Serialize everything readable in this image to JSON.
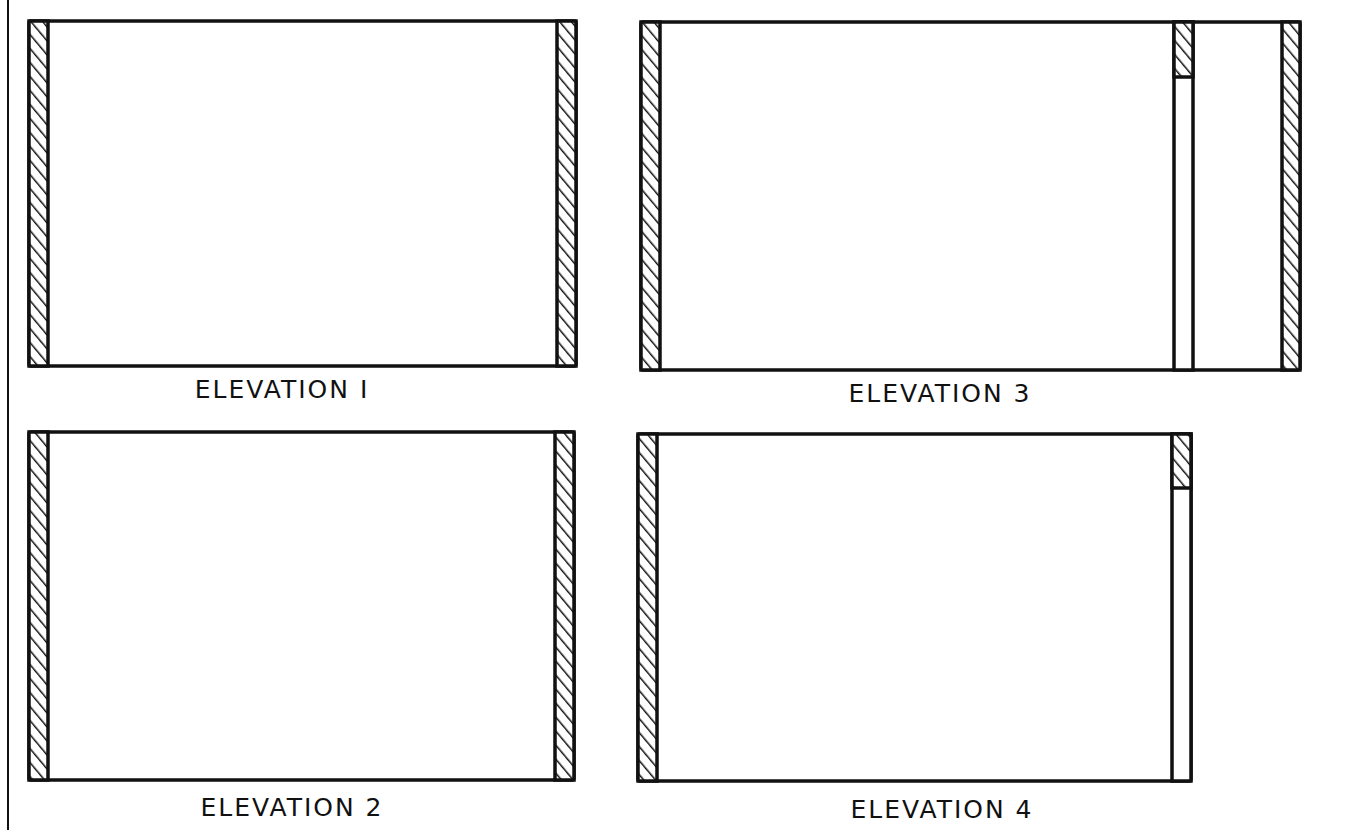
{
  "drawing": {
    "ink_color": "#111111",
    "background": "#ffffff",
    "hatch": "diagonal"
  },
  "elevations": [
    {
      "id": 1,
      "label": "ELEVATION I",
      "frame": {
        "x": 29,
        "y": 21,
        "w": 547,
        "h": 345
      },
      "walls": [
        {
          "x": 29,
          "y": 21,
          "w": 19,
          "h": 345
        },
        {
          "x": 557,
          "y": 21,
          "w": 19,
          "h": 345
        }
      ],
      "openings": [],
      "label_pos": {
        "cx": 282,
        "y": 375
      }
    },
    {
      "id": 3,
      "label": "ELEVATION 3",
      "frame": {
        "x": 641,
        "y": 22,
        "w": 659,
        "h": 348
      },
      "walls": [
        {
          "x": 641,
          "y": 22,
          "w": 19,
          "h": 348
        },
        {
          "x": 1282,
          "y": 22,
          "w": 18,
          "h": 348
        }
      ],
      "openings": [
        {
          "x": 1174,
          "y": 22,
          "w": 19,
          "h": 348,
          "header_h": 55
        }
      ],
      "label_pos": {
        "cx": 940,
        "y": 379
      }
    },
    {
      "id": 2,
      "label": "ELEVATION 2",
      "frame": {
        "x": 29,
        "y": 432,
        "w": 545,
        "h": 348
      },
      "walls": [
        {
          "x": 29,
          "y": 432,
          "w": 19,
          "h": 348
        },
        {
          "x": 555,
          "y": 432,
          "w": 19,
          "h": 348
        }
      ],
      "openings": [],
      "label_pos": {
        "cx": 292,
        "y": 793
      }
    },
    {
      "id": 4,
      "label": "ELEVATION 4",
      "frame": {
        "x": 638,
        "y": 434,
        "w": 553,
        "h": 347
      },
      "walls": [
        {
          "x": 638,
          "y": 434,
          "w": 19,
          "h": 347
        }
      ],
      "openings": [
        {
          "x": 1172,
          "y": 434,
          "w": 19,
          "h": 347,
          "header_h": 54
        }
      ],
      "label_pos": {
        "cx": 942,
        "y": 795
      }
    }
  ],
  "border": {
    "x": 8,
    "y1": 0,
    "y2": 830
  }
}
